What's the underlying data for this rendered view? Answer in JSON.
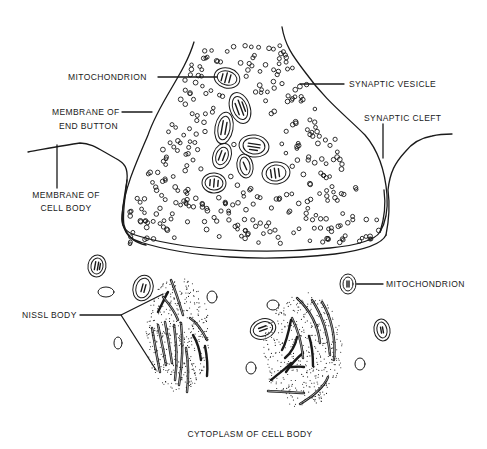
{
  "diagram": {
    "caption": "CYTOPLASM OF CELL BODY",
    "labels": {
      "mitochondrion_top": "MITOCHONDRION",
      "synaptic_vesicle": "SYNAPTIC VESICLE",
      "membrane_end_button_line1": "MEMBRANE OF",
      "membrane_end_button_line2": "END BUTTON",
      "synaptic_cleft": "SYNAPTIC CLEFT",
      "membrane_cell_body_line1": "MEMBRANE OF",
      "membrane_cell_body_line2": "CELL BODY",
      "mitochondrion_right": "MITOCHONDRION",
      "nissl_body": "NISSL BODY"
    },
    "colors": {
      "ink": "#1a1a1a",
      "background": "#ffffff"
    }
  }
}
